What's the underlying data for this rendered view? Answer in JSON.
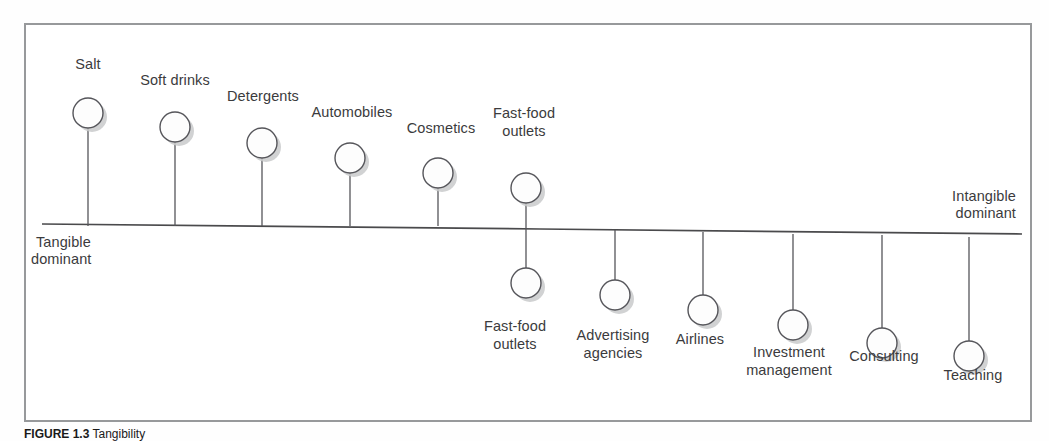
{
  "figure": {
    "axis": {
      "left_label_line1": "Tangible",
      "left_label_line2": "dominant",
      "right_label_line1": "Intangible",
      "right_label_line2": "dominant"
    },
    "caption_prefix": "FIGURE 1.3",
    "caption_text": "Tangibility"
  },
  "chart_data": {
    "type": "scatter",
    "title": "",
    "xlabel": "",
    "ylabel": "",
    "grid": false,
    "legend": "none",
    "axis_endpoints": {
      "left": "Tangible dominant",
      "right": "Intangible dominant"
    },
    "note": "Tangible-dominant to intangible-dominant continuum; bubbles above the line are tangible dominant, bubbles below are intangible dominant.",
    "categories": [
      "Salt",
      "Soft drinks",
      "Detergents",
      "Automobiles",
      "Cosmetics",
      "Fast-food outlets",
      "Fast-food outlets",
      "Advertising agencies",
      "Airlines",
      "Investment management",
      "Consulting",
      "Teaching"
    ],
    "points": [
      {
        "label": "Salt",
        "side": "above",
        "x": 88,
        "cy": 113,
        "r": 15,
        "stem_from": 128,
        "stem_to": 226,
        "label_x": 88,
        "label_y": 69,
        "label_lines": [
          "Salt"
        ],
        "label_anchor": "middle"
      },
      {
        "label": "Soft drinks",
        "side": "above",
        "x": 175,
        "cy": 127,
        "r": 15,
        "stem_from": 142,
        "stem_to": 226,
        "label_x": 175,
        "label_y": 85,
        "label_lines": [
          "Soft drinks"
        ],
        "label_anchor": "middle"
      },
      {
        "label": "Detergents",
        "side": "above",
        "x": 262,
        "cy": 143,
        "r": 15,
        "stem_from": 158,
        "stem_to": 226,
        "label_x": 263,
        "label_y": 101,
        "label_lines": [
          "Detergents"
        ],
        "label_anchor": "middle"
      },
      {
        "label": "Automobiles",
        "side": "above",
        "x": 350,
        "cy": 158,
        "r": 15,
        "stem_from": 173,
        "stem_to": 226,
        "label_x": 352,
        "label_y": 117,
        "label_lines": [
          "Automobiles"
        ],
        "label_anchor": "middle"
      },
      {
        "label": "Cosmetics",
        "side": "above",
        "x": 438,
        "cy": 173,
        "r": 15,
        "stem_from": 188,
        "stem_to": 226,
        "label_x": 441,
        "label_y": 133,
        "label_lines": [
          "Cosmetics"
        ],
        "label_anchor": "middle"
      },
      {
        "label": "Fast-food outlets",
        "side": "above",
        "x": 526,
        "cy": 188,
        "r": 15,
        "stem_from": 203,
        "stem_to": 226,
        "label_x": 524,
        "label_y": 118,
        "label_lines": [
          "Fast-food",
          "outlets"
        ],
        "label_anchor": "middle"
      },
      {
        "label": "Fast-food outlets",
        "side": "below",
        "x": 526,
        "cy": 283,
        "r": 15,
        "stem_from": 226,
        "stem_to": 268,
        "label_x": 515,
        "label_y": 331,
        "label_lines": [
          "Fast-food",
          "outlets"
        ],
        "label_anchor": "middle"
      },
      {
        "label": "Advertising agencies",
        "side": "below",
        "x": 615,
        "cy": 295,
        "r": 15,
        "stem_from": 230,
        "stem_to": 280,
        "label_x": 613,
        "label_y": 340,
        "label_lines": [
          "Advertising",
          "agencies"
        ],
        "label_anchor": "middle"
      },
      {
        "label": "Airlines",
        "side": "below",
        "x": 703,
        "cy": 310,
        "r": 15,
        "stem_from": 232,
        "stem_to": 295,
        "label_x": 700,
        "label_y": 344,
        "label_lines": [
          "Airlines"
        ],
        "label_anchor": "middle"
      },
      {
        "label": "Investment management",
        "side": "below",
        "x": 793,
        "cy": 325,
        "r": 15,
        "stem_from": 234,
        "stem_to": 310,
        "label_x": 789,
        "label_y": 357,
        "label_lines": [
          "Investment",
          "management"
        ],
        "label_anchor": "middle"
      },
      {
        "label": "Consulting",
        "side": "below",
        "x": 882,
        "cy": 343,
        "r": 15,
        "stem_from": 235,
        "stem_to": 328,
        "label_x": 884,
        "label_y": 361,
        "label_lines": [
          "Consulting"
        ],
        "label_anchor": "middle"
      },
      {
        "label": "Teaching",
        "side": "below",
        "x": 969,
        "cy": 356,
        "r": 15,
        "stem_from": 237,
        "stem_to": 341,
        "label_x": 973,
        "label_y": 380,
        "label_lines": [
          "Teaching"
        ],
        "label_anchor": "middle"
      }
    ]
  }
}
